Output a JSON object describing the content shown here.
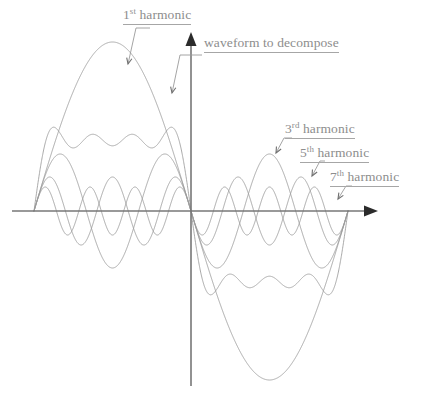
{
  "figure": {
    "background": "#ffffff",
    "curve_color": "#9a9a9a",
    "axis_color": "#777777",
    "label_color": "#8d8d8d"
  },
  "labels": {
    "first_harmonic": {
      "number": "1",
      "ordinal": "st",
      "text": " harmonic"
    },
    "waveform": {
      "text": "waveform to decompose"
    },
    "third_harmonic": {
      "number": "3",
      "ordinal": "rd",
      "text": " harmonic"
    },
    "fifth_harmonic": {
      "number": "5",
      "ordinal": "th",
      "text": " harmonic"
    },
    "seventh_harmonic": {
      "number": "7",
      "ordinal": "th",
      "text": " harmonic"
    }
  },
  "chart_data": {
    "type": "line",
    "xlabel": "",
    "ylabel": "",
    "grid": false,
    "legend": "annotations",
    "axes": {
      "x_axis_y_px": 211,
      "y_axis_x_px": 191,
      "x_axis_from_px": 12,
      "x_axis_to_px": 378,
      "y_axis_top_px": 32,
      "y_axis_bottom_px": 386,
      "arrows": [
        "x-right",
        "y-up"
      ]
    },
    "domain": {
      "x_start_px": 34,
      "x_end_px": 348,
      "period_px": 314
    },
    "series": [
      {
        "name": "1st harmonic",
        "n": 1,
        "amplitude": 169,
        "amplitude_rel": 1.0,
        "peaks": 1,
        "color": "#9a9a9a"
      },
      {
        "name": "3rd harmonic",
        "n": 3,
        "amplitude": 57,
        "amplitude_rel": 0.3333,
        "peaks": 3,
        "color": "#9a9a9a"
      },
      {
        "name": "5th harmonic",
        "n": 5,
        "amplitude": 34,
        "amplitude_rel": 0.2,
        "peaks": 5,
        "color": "#9a9a9a"
      },
      {
        "name": "7th harmonic",
        "n": 7,
        "amplitude": 24,
        "amplitude_rel": 0.1429,
        "peaks": 7,
        "color": "#9a9a9a"
      },
      {
        "name": "waveform to decompose",
        "n": "sum",
        "amplitude": 151,
        "amplitude_rel": 0.893,
        "peaks": 7,
        "color": "#9a9a9a",
        "components": [
          1,
          3,
          5,
          7
        ]
      }
    ],
    "annotations": [
      {
        "label": "1st harmonic",
        "target_x_px": 128,
        "target_y_px": 64,
        "leader_from_x_px": 150,
        "leader_from_y_px": 28
      },
      {
        "label": "waveform to decompose",
        "target_x_px": 172,
        "target_y_px": 93,
        "leader_from_x_px": 202,
        "leader_from_y_px": 55
      },
      {
        "label": "3rd harmonic",
        "target_x_px": 276,
        "target_y_px": 153,
        "leader_from_x_px": 292,
        "leader_from_y_px": 138
      },
      {
        "label": "5th harmonic",
        "target_x_px": 312,
        "target_y_px": 176,
        "leader_from_x_px": 325,
        "leader_from_y_px": 161
      },
      {
        "label": "7th harmonic",
        "target_x_px": 338,
        "target_y_px": 199,
        "leader_from_x_px": 352,
        "leader_from_y_px": 186
      }
    ]
  }
}
